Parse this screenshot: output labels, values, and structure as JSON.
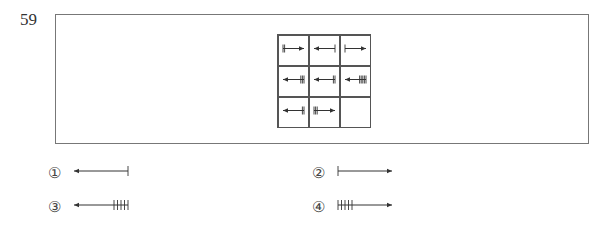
{
  "question": {
    "number": "59"
  },
  "puzzle": {
    "grid_rows": 3,
    "grid_cols": 3,
    "cells": [
      {
        "row": 0,
        "col": 0,
        "direction": "right",
        "ticks": 2,
        "tick_end": "tail",
        "description": "arrow right, 2 ticks at tail (left)"
      },
      {
        "row": 0,
        "col": 1,
        "direction": "left",
        "ticks": 1,
        "tick_end": "tail",
        "description": "arrow left, 1 tick at tail (right)"
      },
      {
        "row": 0,
        "col": 2,
        "direction": "right",
        "ticks": 1,
        "tick_end": "tail",
        "description": "arrow right, 1 tick at tail (left)"
      },
      {
        "row": 1,
        "col": 0,
        "direction": "left",
        "ticks": 3,
        "tick_end": "tail",
        "description": "arrow left, 3 ticks at tail (right)"
      },
      {
        "row": 1,
        "col": 1,
        "direction": "left",
        "ticks": 2,
        "tick_end": "tail",
        "description": "arrow left, 2 ticks at tail (right)"
      },
      {
        "row": 1,
        "col": 2,
        "direction": "left",
        "ticks": 5,
        "tick_end": "tail",
        "description": "arrow left, 5 ticks at tail (right)"
      },
      {
        "row": 2,
        "col": 0,
        "direction": "left",
        "ticks": 2,
        "tick_end": "tail",
        "description": "arrow left, 2 ticks at tail (right)"
      },
      {
        "row": 2,
        "col": 1,
        "direction": "right",
        "ticks": 3,
        "tick_end": "tail",
        "description": "arrow right, 3 ticks at tail (left)"
      },
      {
        "row": 2,
        "col": 2,
        "direction": "",
        "ticks": 0,
        "tick_end": "",
        "description": "empty (answer cell)"
      }
    ]
  },
  "options": [
    {
      "label": "①",
      "direction": "left",
      "ticks": 1
    },
    {
      "label": "②",
      "direction": "right",
      "ticks": 1
    },
    {
      "label": "③",
      "direction": "left",
      "ticks": 5
    },
    {
      "label": "④",
      "direction": "right",
      "ticks": 5
    }
  ],
  "colors": {
    "line": "#333333",
    "frame": "#777777",
    "grid": "#555555"
  }
}
